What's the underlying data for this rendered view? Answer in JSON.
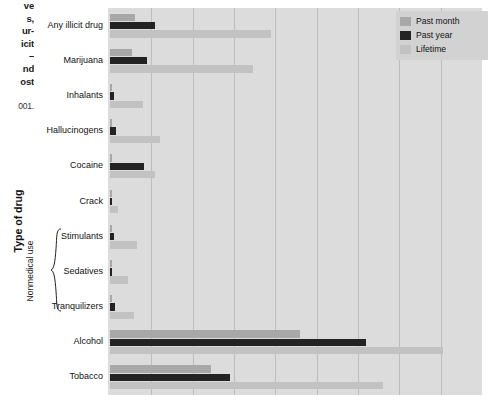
{
  "caption": {
    "lines": [
      "ve",
      "s,",
      "ur-",
      "icit",
      "–",
      "nd",
      "ost"
    ],
    "source": "001."
  },
  "axis": {
    "y_title": "Type of drug",
    "group_bracket_label": "Nonmedical use"
  },
  "legend": {
    "items": [
      {
        "label": "Past month",
        "color": "#a8a8a8",
        "key": "month"
      },
      {
        "label": "Past year",
        "color": "#232323",
        "key": "year"
      },
      {
        "label": "Lifetime",
        "color": "#c2c2c2",
        "key": "life"
      }
    ]
  },
  "chart_data": {
    "type": "bar",
    "orientation": "horizontal",
    "title": "",
    "xlabel": "",
    "ylabel": "Type of drug",
    "xlim": [
      0,
      90
    ],
    "grid": true,
    "gridlines_every": 10,
    "legend_position": "top-right",
    "categories": [
      "Any illicit drug",
      "Marijuana",
      "Inhalants",
      "Hallucinogens",
      "Cocaine",
      "Crack",
      "Stimulants",
      "Sedatives",
      "Tranquilizers",
      "Alcohol",
      "Tobacco"
    ],
    "bracket_group": {
      "label": "Nonmedical use",
      "categories": [
        "Stimulants",
        "Sedatives",
        "Tranquilizers"
      ]
    },
    "series": [
      {
        "name": "Past month",
        "color": "#a8a8a8",
        "values": [
          6.0,
          5.4,
          0.2,
          0.4,
          0.5,
          0.2,
          0.4,
          0.2,
          0.4,
          46.0,
          24.5
        ]
      },
      {
        "name": "Past year",
        "color": "#232323",
        "values": [
          11.0,
          9.0,
          0.9,
          1.4,
          8.2,
          0.4,
          1.0,
          0.4,
          1.2,
          62.0,
          29.0
        ]
      },
      {
        "name": "Lifetime",
        "color": "#c2c2c2",
        "values": [
          39.0,
          34.5,
          8.0,
          12.0,
          10.8,
          2.0,
          6.5,
          4.3,
          5.8,
          80.5,
          66.0
        ]
      }
    ]
  }
}
